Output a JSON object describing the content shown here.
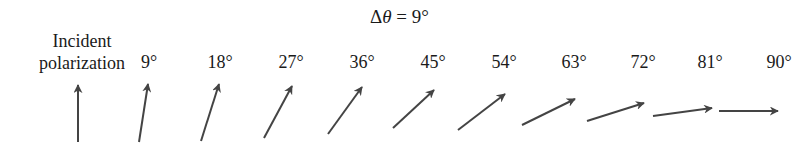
{
  "title": {
    "delta": "Δ",
    "theta": "θ",
    "rest": " = 9°"
  },
  "incident_label": {
    "line1": "Incident",
    "line2": "polarization"
  },
  "color": "#444444",
  "angles": [
    {
      "label": "9°",
      "x": 149
    },
    {
      "label": "18°",
      "x": 220
    },
    {
      "label": "27°",
      "x": 291
    },
    {
      "label": "36°",
      "x": 362
    },
    {
      "label": "45°",
      "x": 433
    },
    {
      "label": "54°",
      "x": 504
    },
    {
      "label": "63°",
      "x": 574
    },
    {
      "label": "72°",
      "x": 643
    },
    {
      "label": "81°",
      "x": 710
    },
    {
      "label": "90°",
      "x": 779
    }
  ],
  "arrows": [
    {
      "name": "incident",
      "x1": 78,
      "y1": 142,
      "x2": 78,
      "y2": 85
    },
    {
      "name": "9",
      "x1": 139,
      "y1": 142,
      "x2": 148,
      "y2": 84
    },
    {
      "name": "18",
      "x1": 201,
      "y1": 141,
      "x2": 219,
      "y2": 84
    },
    {
      "name": "27",
      "x1": 264,
      "y1": 138,
      "x2": 292,
      "y2": 86
    },
    {
      "name": "36",
      "x1": 328,
      "y1": 134,
      "x2": 362,
      "y2": 87
    },
    {
      "name": "45",
      "x1": 393,
      "y1": 128,
      "x2": 434,
      "y2": 90
    },
    {
      "name": "54",
      "x1": 458,
      "y1": 130,
      "x2": 505,
      "y2": 94
    },
    {
      "name": "63",
      "x1": 522,
      "y1": 125,
      "x2": 575,
      "y2": 99
    },
    {
      "name": "72",
      "x1": 587,
      "y1": 121,
      "x2": 644,
      "y2": 103
    },
    {
      "name": "81",
      "x1": 653,
      "y1": 116,
      "x2": 712,
      "y2": 108
    },
    {
      "name": "90",
      "x1": 719,
      "y1": 111,
      "x2": 778,
      "y2": 111
    }
  ]
}
